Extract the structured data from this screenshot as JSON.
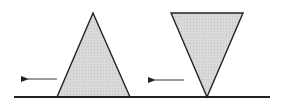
{
  "diagram": {
    "colors": {
      "background": "#ffffff",
      "stroke": "#222222",
      "fill": "#d6d6d6",
      "arrow": "#555555"
    },
    "ground": {
      "x1": 14,
      "x2": 270,
      "y": 97
    },
    "shapes": [
      {
        "name": "upright-triangle",
        "points": "57,97 93,13 130,97",
        "arrow": {
          "x1": 57,
          "x2": 21,
          "y": 79
        }
      },
      {
        "name": "inverted-triangle",
        "points": "171,13 243,13 207,97",
        "arrow": {
          "x1": 184,
          "x2": 148,
          "y": 80
        }
      }
    ]
  }
}
